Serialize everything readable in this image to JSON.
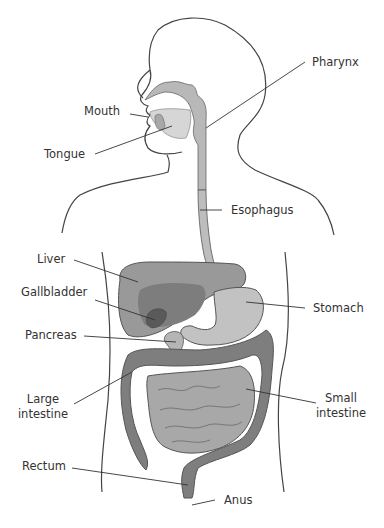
{
  "colors": {
    "outline": "#444444",
    "organ_light": "#c4c4c4",
    "organ_mid": "#a6a6a6",
    "organ_dark": "#7c7c7c",
    "gallbladder": "#5e5e5e",
    "leader": "#333333",
    "text": "#333333",
    "background": "#ffffff"
  },
  "labels": {
    "pharynx": "Pharynx",
    "mouth": "Mouth",
    "tongue": "Tongue",
    "esophagus": "Esophagus",
    "liver": "Liver",
    "gallbladder": "Gallbladder",
    "stomach": "Stomach",
    "pancreas": "Pancreas",
    "large_intestine_1": "Large",
    "large_intestine_2": "intestine",
    "small_intestine_1": "Small",
    "small_intestine_2": "intestine",
    "rectum": "Rectum",
    "anus": "Anus"
  }
}
